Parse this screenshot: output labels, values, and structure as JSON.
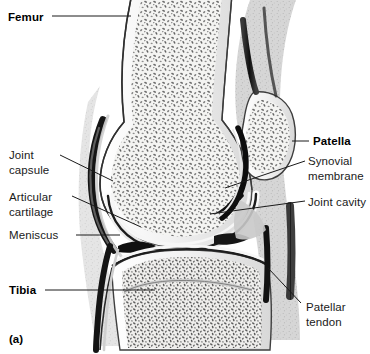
{
  "figure": {
    "caption": "(a)",
    "background_color": "#ffffff",
    "ink_color": "#1a1a1a"
  },
  "labels": [
    {
      "id": "femur",
      "text": "Femur",
      "bold": true,
      "x": 8,
      "y": 10,
      "leader": [
        [
          52,
          16
        ],
        [
          131,
          16
        ]
      ]
    },
    {
      "id": "joint-capsule",
      "text": "Joint\ncapsule",
      "bold": false,
      "x": 9,
      "y": 148,
      "leader": [
        [
          60,
          155
        ],
        [
          113,
          181
        ]
      ]
    },
    {
      "id": "articular-cartilage",
      "text": "Articular\ncartilage",
      "bold": false,
      "x": 9,
      "y": 190,
      "leader": [
        [
          72,
          196
        ],
        [
          141,
          227
        ]
      ]
    },
    {
      "id": "meniscus",
      "text": "Meniscus",
      "bold": false,
      "x": 9,
      "y": 228,
      "leader": [
        [
          76,
          235
        ],
        [
          120,
          235
        ]
      ]
    },
    {
      "id": "tibia",
      "text": "Tibia",
      "bold": true,
      "x": 9,
      "y": 283,
      "leader": [
        [
          45,
          290
        ],
        [
          155,
          290
        ]
      ]
    },
    {
      "id": "patella",
      "text": "Patella",
      "bold": true,
      "x": 313,
      "y": 134,
      "leader": [
        [
          292,
          141
        ],
        [
          309,
          141
        ]
      ]
    },
    {
      "id": "synovial-membrane",
      "text": "Synovial\nmembrane",
      "bold": false,
      "x": 308,
      "y": 154,
      "leader": [
        [
          225,
          188
        ],
        [
          305,
          161
        ]
      ]
    },
    {
      "id": "joint-cavity",
      "text": "Joint cavity",
      "bold": false,
      "x": 308,
      "y": 195,
      "leader": [
        [
          210,
          214
        ],
        [
          305,
          201
        ]
      ]
    },
    {
      "id": "patellar-tendon",
      "text": "Patellar\ntendon",
      "bold": false,
      "x": 306,
      "y": 300,
      "leader": [
        [
          268,
          268
        ],
        [
          301,
          303
        ]
      ]
    }
  ],
  "structures": [
    {
      "id": "femur-shaft",
      "name": "femur",
      "tissue": "spongy-bone"
    },
    {
      "id": "femoral-condyle",
      "name": "femoral condyle",
      "tissue": "spongy-bone"
    },
    {
      "id": "patella-bone",
      "name": "patella",
      "tissue": "spongy-bone"
    },
    {
      "id": "tibia-bone",
      "name": "tibia",
      "tissue": "spongy-bone"
    },
    {
      "id": "joint-capsule-band",
      "name": "joint capsule",
      "tissue": "dense-connective"
    },
    {
      "id": "articular-cartilage-layer",
      "name": "articular cartilage",
      "tissue": "cartilage"
    },
    {
      "id": "meniscus-wedge",
      "name": "meniscus",
      "tissue": "fibrocartilage"
    },
    {
      "id": "synovial-membrane-layer",
      "name": "synovial membrane",
      "tissue": "membrane"
    },
    {
      "id": "joint-cavity-space",
      "name": "joint cavity",
      "tissue": "cavity"
    },
    {
      "id": "patellar-tendon-band",
      "name": "patellar tendon",
      "tissue": "tendon"
    },
    {
      "id": "quadriceps-tendon-band",
      "name": "quadriceps tendon",
      "tissue": "tendon"
    }
  ]
}
